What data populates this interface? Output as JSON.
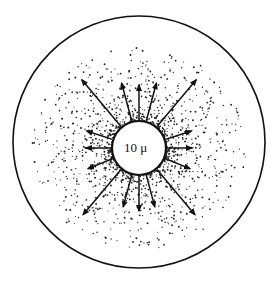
{
  "diagram": {
    "center_label": "10 μ",
    "colors": {
      "ink": "#111111",
      "background": "#ffffff"
    },
    "outer_circle": {
      "cx": 139,
      "cy": 142,
      "r": 126
    },
    "inner_circle": {
      "cx": 139,
      "cy": 148,
      "r": 27
    },
    "arrows": [
      {
        "angle": -130,
        "length": 62
      },
      {
        "angle": -105,
        "length": 40
      },
      {
        "angle": -90,
        "length": 36
      },
      {
        "angle": -75,
        "length": 40
      },
      {
        "angle": -50,
        "length": 62
      },
      {
        "angle": -162,
        "length": 28
      },
      {
        "angle": -18,
        "length": 28
      },
      {
        "angle": 180,
        "length": 26
      },
      {
        "angle": 0,
        "length": 26
      },
      {
        "angle": 158,
        "length": 28
      },
      {
        "angle": 22,
        "length": 28
      },
      {
        "angle": 130,
        "length": 60
      },
      {
        "angle": 105,
        "length": 34
      },
      {
        "angle": 90,
        "length": 36
      },
      {
        "angle": 75,
        "length": 34
      },
      {
        "angle": 50,
        "length": 60
      }
    ]
  }
}
